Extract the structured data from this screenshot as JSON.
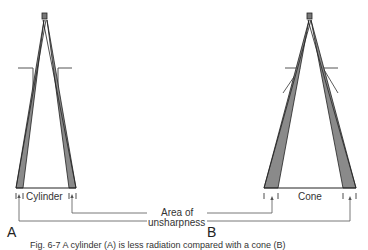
{
  "diagram": {
    "panels": [
      {
        "letter": "A",
        "device_label": "Cylinder"
      },
      {
        "letter": "B",
        "device_label": "Cone"
      }
    ],
    "shared_label_line1": "Area of",
    "shared_label_line2": "unsharpness",
    "caption": "Fig. 6-7 A cylinder (A) is less radiation compared with a cone (B)",
    "colors": {
      "line": "#222222",
      "shade": "#8a8a8a",
      "leader": "#555555"
    }
  }
}
